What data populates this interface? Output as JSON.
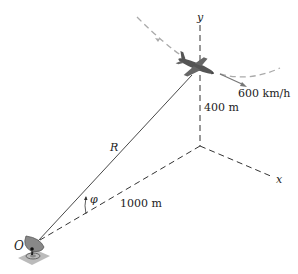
{
  "diagram": {
    "labels": {
      "y_axis": "y",
      "x_axis": "x",
      "speed": "600 km/h",
      "height": "400 m",
      "range": "R",
      "angle": "φ",
      "distance": "1000 m",
      "origin": "O"
    },
    "colors": {
      "line": "#333333",
      "dashed_path": "#aaaaaa",
      "aircraft": "#555555",
      "radar": "#777777",
      "radar_base": "#bbbbbb"
    }
  }
}
